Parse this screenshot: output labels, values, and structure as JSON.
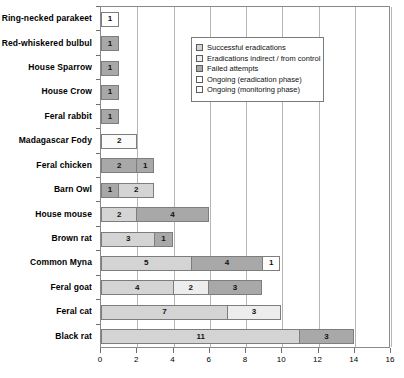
{
  "chart_data": {
    "type": "bar",
    "orientation": "horizontal",
    "stacked": true,
    "title": "",
    "xlabel": "",
    "ylabel": "",
    "xlim": [
      0,
      16
    ],
    "xticks": [
      0,
      2,
      4,
      6,
      8,
      10,
      12,
      14,
      16
    ],
    "grid": true,
    "legend_position": "top-right",
    "series": [
      {
        "name": "Successful eradications",
        "key": "success",
        "color": "#d4d4d4"
      },
      {
        "name": "Eradications indirect / from control",
        "key": "indirect",
        "color": "#ededed"
      },
      {
        "name": "Failed attempts",
        "key": "failed",
        "color": "#a8a8a8"
      },
      {
        "name": "Ongoing (eradication phase)",
        "key": "ongoing_erad",
        "color": "#ffffff"
      },
      {
        "name": "Ongoing (monitoring phase)",
        "key": "ongoing_mon",
        "color": "#fbfbfb"
      }
    ],
    "categories": [
      "Ring-necked parakeet",
      "Red-whiskered bulbul",
      "House Sparrow",
      "House Crow",
      "Feral rabbit",
      "Madagascar Fody",
      "Feral chicken",
      "Barn Owl",
      "House mouse",
      "Brown rat",
      "Common Myna",
      "Feral goat",
      "Feral cat",
      "Black rat"
    ],
    "rows": [
      {
        "category": "Ring-necked parakeet",
        "total": 1,
        "segments": [
          {
            "series": "Ongoing (eradication phase)",
            "fill": "ongoing_erad",
            "value": 1,
            "label": "1"
          }
        ]
      },
      {
        "category": "Red-whiskered bulbul",
        "total": 1,
        "segments": [
          {
            "series": "Failed attempts",
            "fill": "failed",
            "value": 1,
            "label": "1"
          }
        ]
      },
      {
        "category": "House Sparrow",
        "total": 1,
        "segments": [
          {
            "series": "Failed attempts",
            "fill": "failed",
            "value": 1,
            "label": "1"
          }
        ]
      },
      {
        "category": "House Crow",
        "total": 1,
        "segments": [
          {
            "series": "Failed attempts",
            "fill": "failed",
            "value": 1,
            "label": "1"
          }
        ]
      },
      {
        "category": "Feral rabbit",
        "total": 1,
        "segments": [
          {
            "series": "Failed attempts",
            "fill": "failed",
            "value": 1,
            "label": "1"
          }
        ]
      },
      {
        "category": "Madagascar Fody",
        "total": 2,
        "segments": [
          {
            "series": "Ongoing (monitoring phase)",
            "fill": "ongoing_mon",
            "value": 2,
            "label": "2"
          }
        ]
      },
      {
        "category": "Feral chicken",
        "total": 3,
        "segments": [
          {
            "series": "Failed attempts",
            "fill": "failed",
            "value": 2,
            "label": "2"
          },
          {
            "series": "Failed attempts",
            "fill": "failed",
            "value": 1,
            "label": "1"
          }
        ]
      },
      {
        "category": "Barn Owl",
        "total": 3,
        "segments": [
          {
            "series": "Failed attempts",
            "fill": "failed",
            "value": 1,
            "label": "1"
          },
          {
            "series": "Successful eradications",
            "fill": "success",
            "value": 2,
            "label": "2"
          }
        ]
      },
      {
        "category": "House mouse",
        "total": 6,
        "segments": [
          {
            "series": "Successful eradications",
            "fill": "success",
            "value": 2,
            "label": "2"
          },
          {
            "series": "Failed attempts",
            "fill": "failed",
            "value": 4,
            "label": "4"
          }
        ]
      },
      {
        "category": "Brown rat",
        "total": 4,
        "segments": [
          {
            "series": "Successful eradications",
            "fill": "success",
            "value": 3,
            "label": "3"
          },
          {
            "series": "Failed attempts",
            "fill": "failed",
            "value": 1,
            "label": "1"
          }
        ]
      },
      {
        "category": "Common Myna",
        "total": 10,
        "segments": [
          {
            "series": "Successful eradications",
            "fill": "success",
            "value": 5,
            "label": "5"
          },
          {
            "series": "Failed attempts",
            "fill": "failed",
            "value": 4,
            "label": "4"
          },
          {
            "series": "Ongoing (eradication phase)",
            "fill": "ongoing_erad",
            "value": 1,
            "label": "1"
          }
        ]
      },
      {
        "category": "Feral goat",
        "total": 9,
        "segments": [
          {
            "series": "Successful eradications",
            "fill": "success",
            "value": 4,
            "label": "4"
          },
          {
            "series": "Eradications indirect / from control",
            "fill": "indirect",
            "value": 2,
            "label": "2"
          },
          {
            "series": "Failed attempts",
            "fill": "failed",
            "value": 3,
            "label": "3"
          }
        ]
      },
      {
        "category": "Feral cat",
        "total": 10,
        "segments": [
          {
            "series": "Successful eradications",
            "fill": "success",
            "value": 7,
            "label": "7"
          },
          {
            "series": "Eradications indirect / from control",
            "fill": "indirect",
            "value": 3,
            "label": "3"
          }
        ]
      },
      {
        "category": "Black rat",
        "total": 14,
        "segments": [
          {
            "series": "Successful eradications",
            "fill": "success",
            "value": 11,
            "label": "11"
          },
          {
            "series": "Failed attempts",
            "fill": "failed",
            "value": 3,
            "label": "3"
          }
        ]
      }
    ]
  },
  "legend": {
    "items": [
      {
        "label": "Successful eradications",
        "fill": "success"
      },
      {
        "label": "Eradications indirect / from control",
        "fill": "indirect"
      },
      {
        "label": "Failed attempts",
        "fill": "failed"
      },
      {
        "label": "Ongoing (eradication phase)",
        "fill": "ongoing_erad"
      },
      {
        "label": "Ongoing (monitoring phase)",
        "fill": "ongoing_mon"
      }
    ]
  },
  "colors": {
    "success": "#d4d4d4",
    "indirect": "#ededed",
    "failed": "#a8a8a8",
    "ongoing_erad": "#ffffff",
    "ongoing_mon": "#fbfbfb",
    "axis": "#8a8a8a",
    "grid": "#b5b5b5",
    "text": "#000000"
  }
}
